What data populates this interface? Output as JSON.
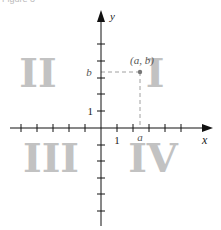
{
  "figure": {
    "header": "Figure 3",
    "axes": {
      "x_label": "x",
      "y_label": "y",
      "x_tick_label": "1",
      "y_tick_label": "1"
    },
    "point": {
      "label": "(a, b)",
      "x_label": "a",
      "y_label": "b"
    },
    "quadrants": {
      "I": "I",
      "II": "II",
      "III": "III",
      "IV": "IV"
    },
    "colors": {
      "axis": "#111111",
      "quadrant_numeral": "#c2c2c2",
      "dashed_guide": "#888888",
      "point": "#777777"
    }
  }
}
